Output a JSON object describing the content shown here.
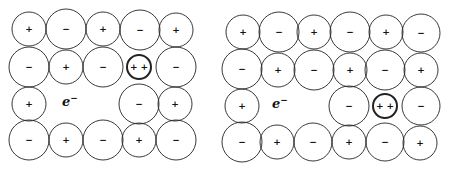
{
  "colors": {
    "stroke": "#222222",
    "ink": "#111111",
    "background": "#ffffff"
  },
  "panels": [
    {
      "name": "left-lattice",
      "electron": {
        "label": "e",
        "superscript": "−",
        "x": 62,
        "y": 106
      },
      "ions": [
        {
          "x": 29,
          "y": 29,
          "r": 17,
          "charge": "+"
        },
        {
          "x": 66,
          "y": 29,
          "r": 20,
          "charge": "−"
        },
        {
          "x": 103,
          "y": 29,
          "r": 17,
          "charge": "+"
        },
        {
          "x": 140,
          "y": 30,
          "r": 20,
          "charge": "−"
        },
        {
          "x": 176,
          "y": 30,
          "r": 17,
          "charge": "+"
        },
        {
          "x": 29,
          "y": 67,
          "r": 20,
          "charge": "−"
        },
        {
          "x": 66,
          "y": 67,
          "r": 17,
          "charge": "+"
        },
        {
          "x": 103,
          "y": 67,
          "r": 20,
          "charge": "−"
        },
        {
          "x": 139,
          "y": 67,
          "r": 12,
          "charge": "+ +",
          "bold": true
        },
        {
          "x": 176,
          "y": 67,
          "r": 20,
          "charge": "−"
        },
        {
          "x": 29,
          "y": 104,
          "r": 17,
          "charge": "+"
        },
        {
          "x": 139,
          "y": 104,
          "r": 20,
          "charge": "−"
        },
        {
          "x": 175,
          "y": 104,
          "r": 17,
          "charge": "+"
        },
        {
          "x": 29,
          "y": 140,
          "r": 20,
          "charge": "−"
        },
        {
          "x": 66,
          "y": 140,
          "r": 17,
          "charge": "+"
        },
        {
          "x": 103,
          "y": 140,
          "r": 20,
          "charge": "−"
        },
        {
          "x": 139,
          "y": 140,
          "r": 17,
          "charge": "+"
        },
        {
          "x": 176,
          "y": 140,
          "r": 20,
          "charge": "−"
        }
      ]
    },
    {
      "name": "right-lattice",
      "electron": {
        "label": "e",
        "superscript": "−",
        "x": 272,
        "y": 108
      },
      "ions": [
        {
          "x": 243,
          "y": 32,
          "r": 17,
          "charge": "+"
        },
        {
          "x": 279,
          "y": 32,
          "r": 20,
          "charge": "−"
        },
        {
          "x": 314,
          "y": 32,
          "r": 17,
          "charge": "+"
        },
        {
          "x": 350,
          "y": 32,
          "r": 20,
          "charge": "−"
        },
        {
          "x": 386,
          "y": 32,
          "r": 17,
          "charge": "+"
        },
        {
          "x": 421,
          "y": 33,
          "r": 19,
          "charge": "−"
        },
        {
          "x": 242,
          "y": 69,
          "r": 20,
          "charge": "−"
        },
        {
          "x": 278,
          "y": 70,
          "r": 17,
          "charge": "+"
        },
        {
          "x": 314,
          "y": 70,
          "r": 20,
          "charge": "−"
        },
        {
          "x": 350,
          "y": 70,
          "r": 17,
          "charge": "+"
        },
        {
          "x": 385,
          "y": 70,
          "r": 20,
          "charge": "−"
        },
        {
          "x": 421,
          "y": 70,
          "r": 17,
          "charge": "+"
        },
        {
          "x": 242,
          "y": 106,
          "r": 17,
          "charge": "+"
        },
        {
          "x": 349,
          "y": 106,
          "r": 20,
          "charge": "−"
        },
        {
          "x": 385,
          "y": 106,
          "r": 12,
          "charge": "+ +",
          "bold": true
        },
        {
          "x": 421,
          "y": 106,
          "r": 19,
          "charge": "−"
        },
        {
          "x": 242,
          "y": 142,
          "r": 20,
          "charge": "−"
        },
        {
          "x": 277,
          "y": 142,
          "r": 17,
          "charge": "+"
        },
        {
          "x": 313,
          "y": 142,
          "r": 19,
          "charge": "−"
        },
        {
          "x": 349,
          "y": 142,
          "r": 17,
          "charge": "+"
        },
        {
          "x": 385,
          "y": 142,
          "r": 19,
          "charge": "−"
        },
        {
          "x": 420,
          "y": 143,
          "r": 17,
          "charge": "+"
        }
      ]
    }
  ]
}
